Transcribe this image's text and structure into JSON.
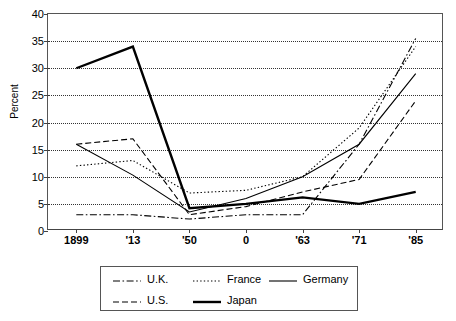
{
  "chart_data": {
    "type": "line",
    "title": "",
    "xlabel": "",
    "ylabel": "Percent",
    "ylim": [
      0,
      40
    ],
    "ytick_values": [
      0,
      5,
      10,
      15,
      20,
      25,
      30,
      35,
      40
    ],
    "ytick_labels": [
      "0",
      "5",
      "10",
      "15",
      "20",
      "25",
      "30",
      "35",
      "40"
    ],
    "grid": "horizontal-dotted",
    "categories": [
      "1899",
      "'13",
      "'50",
      "0",
      "'63",
      "'71",
      "'85"
    ],
    "x_positions": [
      0,
      1,
      2,
      3,
      4,
      5,
      6
    ],
    "legend_position": "below-center",
    "series": [
      {
        "name": "U.K.",
        "style": "dash-dot",
        "color": "#000000",
        "width": 1.1,
        "values": [
          3.0,
          3.0,
          2.2,
          3.0,
          3.0,
          16.0,
          35.5
        ]
      },
      {
        "name": "U.S.",
        "style": "dashed",
        "color": "#000000",
        "width": 1.1,
        "values": [
          16.0,
          17.0,
          3.0,
          4.5,
          7.2,
          9.5,
          24.0
        ]
      },
      {
        "name": "France",
        "style": "dotted",
        "color": "#000000",
        "width": 1.1,
        "values": [
          12.0,
          13.0,
          7.0,
          7.5,
          10.0,
          19.0,
          34.0
        ]
      },
      {
        "name": "Japan",
        "style": "solid-thick",
        "color": "#000000",
        "width": 2.4,
        "values": [
          30.0,
          34.0,
          4.2,
          5.0,
          6.2,
          5.0,
          7.2
        ]
      },
      {
        "name": "Germany",
        "style": "solid-thin",
        "color": "#000000",
        "width": 1.1,
        "values": [
          16.0,
          10.3,
          3.5,
          6.0,
          10.0,
          16.0,
          29.0
        ]
      }
    ]
  },
  "legend": {
    "rows": [
      [
        {
          "label": "U.K.",
          "series": "U.K."
        },
        {
          "label": "France",
          "series": "France"
        },
        {
          "label": "Germany",
          "series": "Germany"
        }
      ],
      [
        {
          "label": "U.S.",
          "series": "U.S."
        },
        {
          "label": "Japan",
          "series": "Japan"
        }
      ]
    ]
  }
}
